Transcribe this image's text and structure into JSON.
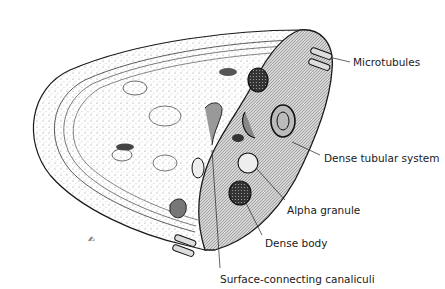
{
  "figure": {
    "labels": [
      {
        "id": "microtubules",
        "text": "Microtubules",
        "x": 353,
        "y": 56
      },
      {
        "id": "dense-tubular-system",
        "text": "Dense tubular system",
        "x": 324,
        "y": 152
      },
      {
        "id": "alpha-granule",
        "text": "Alpha granule",
        "x": 287,
        "y": 204
      },
      {
        "id": "dense-body",
        "text": "Dense body",
        "x": 265,
        "y": 237
      },
      {
        "id": "surface-connecting-canaliculi",
        "text": "Surface-connecting canaliculi",
        "x": 220,
        "y": 273
      }
    ],
    "colors": {
      "outline": "#1a1a1a",
      "cut_face": "#c8c8c8",
      "stipple": "#9a9a9a",
      "background": "#ffffff"
    }
  }
}
